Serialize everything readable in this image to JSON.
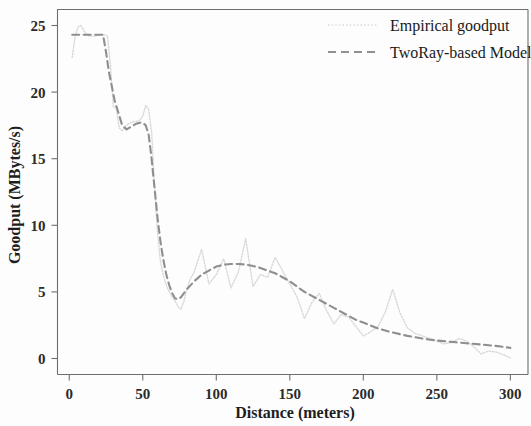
{
  "chart_data": {
    "type": "line",
    "title": "",
    "xlabel": "Distance (meters)",
    "ylabel": "Goodput (MBytes/s)",
    "xlim": [
      -8,
      312
    ],
    "ylim": [
      -1.2,
      26.2
    ],
    "xticks": [
      0,
      50,
      100,
      150,
      200,
      250,
      300
    ],
    "xtick_labels": [
      "0",
      "50",
      "100",
      "150",
      "200",
      "250",
      "300"
    ],
    "yticks": [
      0,
      5,
      10,
      15,
      20,
      25
    ],
    "ytick_labels": [
      "0",
      "5",
      "10",
      "15",
      "20",
      "25"
    ],
    "grid": false,
    "legend_position": "top-right",
    "series": [
      {
        "name": "Empirical goodput",
        "style": "dotted",
        "color": "#d9d9d9",
        "x": [
          2,
          4,
          6,
          8,
          10,
          12,
          14,
          16,
          18,
          20,
          22,
          24,
          26,
          28,
          30,
          32,
          34,
          36,
          38,
          40,
          42,
          44,
          46,
          48,
          50,
          52,
          54,
          56,
          58,
          60,
          62,
          64,
          66,
          68,
          70,
          72,
          74,
          76,
          78,
          80,
          82,
          85,
          90,
          95,
          100,
          105,
          110,
          115,
          120,
          125,
          130,
          135,
          140,
          145,
          150,
          155,
          160,
          165,
          170,
          175,
          180,
          185,
          190,
          195,
          200,
          205,
          210,
          215,
          220,
          225,
          230,
          235,
          240,
          245,
          250,
          255,
          260,
          265,
          270,
          275,
          280,
          285,
          290,
          295,
          300
        ],
        "y": [
          22.6,
          24.2,
          24.9,
          25.0,
          24.6,
          24.3,
          24.2,
          24.2,
          24.2,
          24.3,
          24.3,
          24.3,
          24.2,
          22.0,
          18.9,
          18.8,
          17.3,
          17.1,
          17.4,
          17.6,
          17.7,
          17.8,
          17.8,
          17.9,
          18.2,
          19.0,
          18.7,
          17.0,
          13.0,
          9.5,
          7.3,
          6.2,
          5.5,
          5.0,
          4.6,
          4.3,
          3.9,
          3.7,
          4.3,
          5.2,
          5.9,
          6.5,
          8.2,
          5.6,
          6.3,
          7.5,
          5.3,
          6.5,
          9.0,
          5.4,
          6.3,
          6.1,
          7.6,
          6.6,
          5.6,
          4.6,
          3.0,
          4.2,
          4.9,
          3.6,
          2.6,
          3.3,
          3.1,
          2.4,
          1.7,
          2.0,
          2.4,
          3.5,
          5.2,
          3.4,
          2.3,
          1.9,
          1.7,
          1.5,
          1.3,
          1.1,
          1.2,
          1.5,
          1.3,
          0.9,
          0.35,
          0.55,
          0.5,
          0.3,
          0.05
        ]
      },
      {
        "name": "TwoRay-based Model",
        "style": "dashed",
        "color": "#8f8f8f",
        "x": [
          2,
          6,
          10,
          14,
          18,
          21,
          23,
          25,
          27,
          29,
          31,
          33,
          36,
          39,
          42,
          45,
          48,
          50,
          52,
          54,
          56,
          58,
          60,
          62,
          64,
          66,
          68,
          70,
          72,
          74,
          76,
          80,
          85,
          90,
          95,
          100,
          105,
          110,
          115,
          120,
          125,
          130,
          135,
          140,
          145,
          150,
          155,
          160,
          165,
          170,
          175,
          180,
          185,
          190,
          195,
          200,
          210,
          220,
          230,
          240,
          250,
          260,
          270,
          280,
          290,
          300
        ],
        "y": [
          24.3,
          24.3,
          24.3,
          24.3,
          24.3,
          24.3,
          24.3,
          23.0,
          21.5,
          20.4,
          19.3,
          18.6,
          17.5,
          17.2,
          17.4,
          17.6,
          17.7,
          17.7,
          17.5,
          16.8,
          15.0,
          12.8,
          10.6,
          8.8,
          7.4,
          6.3,
          5.5,
          4.9,
          4.5,
          4.45,
          4.6,
          5.2,
          5.8,
          6.3,
          6.6,
          6.9,
          7.05,
          7.1,
          7.1,
          7.05,
          6.95,
          6.8,
          6.6,
          6.4,
          6.1,
          5.8,
          5.4,
          5.0,
          4.7,
          4.4,
          4.1,
          3.8,
          3.5,
          3.2,
          2.9,
          2.7,
          2.25,
          1.95,
          1.7,
          1.5,
          1.35,
          1.25,
          1.15,
          1.05,
          0.95,
          0.8
        ]
      }
    ]
  },
  "legend": {
    "entries": [
      {
        "label": "Empirical goodput"
      },
      {
        "label": "TwoRay-based Model"
      }
    ]
  }
}
